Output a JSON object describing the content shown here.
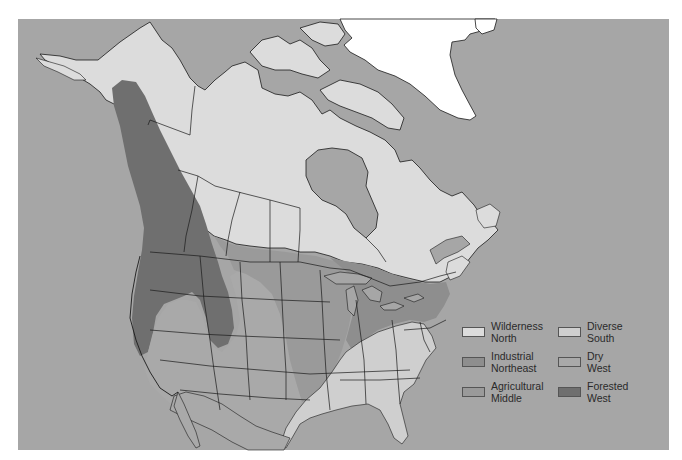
{
  "map": {
    "title": "",
    "region": "North America",
    "colors": {
      "ocean": "#a6a6a6",
      "greenland": "#ffffff",
      "border": "#1a1a1a"
    }
  },
  "legend": {
    "items": [
      {
        "line1": "Wilderness",
        "line2": "North",
        "color": "#dcdcdc"
      },
      {
        "line1": "Diverse",
        "line2": "South",
        "color": "#cfcfcf"
      },
      {
        "line1": "Industrial",
        "line2": "Northeast",
        "color": "#8e8e8e"
      },
      {
        "line1": "Dry",
        "line2": "West",
        "color": "#a9a9a9"
      },
      {
        "line1": "Agricultural",
        "line2": "Middle",
        "color": "#9a9a9a"
      },
      {
        "line1": "Forested",
        "line2": "West",
        "color": "#6f6f6f"
      }
    ]
  }
}
